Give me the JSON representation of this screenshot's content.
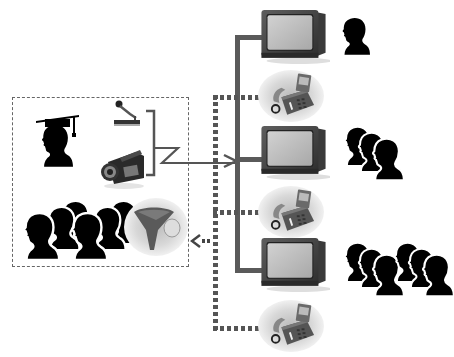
{
  "diagram": {
    "title": "Distance learning videoconference network",
    "colors": {
      "trunk_line": "#5a5a5a",
      "audio_return_line": "#555555",
      "silhouette": "#000000",
      "tv_body": "#4a4a4a",
      "tv_screen": "#bdbdbd",
      "phone_halo": "#c8c8c8",
      "dashed_box_border": "#666666"
    },
    "source_site": {
      "label": "Origin classroom",
      "elements": [
        {
          "name": "teacher",
          "icon": "graduate-silhouette-icon"
        },
        {
          "name": "microphone",
          "icon": "microphone-icon"
        },
        {
          "name": "video-camera",
          "icon": "camcorder-icon"
        },
        {
          "name": "local-students",
          "icon": "group-silhouette-icon",
          "count": 6
        },
        {
          "name": "conference-speakerphone",
          "icon": "speakerphone-icon"
        }
      ]
    },
    "remote_sites": [
      {
        "label": "Remote site 1",
        "devices": [
          "tv-monitor-icon",
          "telephone-icon"
        ],
        "audience_count": 1
      },
      {
        "label": "Remote site 2",
        "devices": [
          "tv-monitor-icon",
          "telephone-icon"
        ],
        "audience_count": 3
      },
      {
        "label": "Remote site 3",
        "devices": [
          "tv-monitor-icon",
          "telephone-icon"
        ],
        "audience_count": 6
      }
    ],
    "connections": {
      "video_out": "solid line with arrow from camera/mic bracket to remote TVs",
      "audio_back": "dotted line from remote phones with arrow back to speakerphone"
    }
  }
}
